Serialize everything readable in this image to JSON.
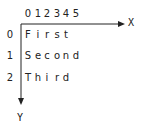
{
  "diagram": {
    "x_axis_label": "X",
    "y_axis_label": "Y",
    "column_indices": [
      "0",
      "1",
      "2",
      "3",
      "4",
      "5"
    ],
    "rows": [
      {
        "index": "0",
        "chars": [
          "F",
          "i",
          "r",
          "s",
          "t"
        ]
      },
      {
        "index": "1",
        "chars": [
          "S",
          "e",
          "c",
          "o",
          "n",
          "d"
        ]
      },
      {
        "index": "2",
        "chars": [
          "T",
          "h",
          "i",
          "r",
          "d"
        ]
      }
    ],
    "colors": {
      "ink": "#222222",
      "background": "#ffffff"
    }
  }
}
